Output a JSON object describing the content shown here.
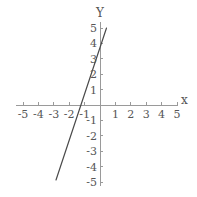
{
  "figure": {
    "background_color": "#ffffff",
    "axis_color": "#9a9a9a",
    "line_color": "#4a4a4a",
    "label_color": "#565656"
  },
  "axes": {
    "x_axis_name": "x",
    "y_axis_name": "Y",
    "x_tick_labels": [
      "-5",
      "-4",
      "-3",
      "-2",
      "-1",
      "1",
      "2",
      "3",
      "4",
      "5"
    ],
    "y_tick_labels": [
      "5",
      "4",
      "3",
      "2",
      "1",
      "-1",
      "-2",
      "-3",
      "-4",
      "-5"
    ]
  },
  "chart_data": {
    "type": "line",
    "title": "",
    "xlabel": "x",
    "ylabel": "Y",
    "xlim": [
      -5.4,
      5.0
    ],
    "ylim": [
      -5.4,
      5.4
    ],
    "xticks": [
      -5,
      -4,
      -3,
      -2,
      -1,
      1,
      2,
      3,
      4,
      5
    ],
    "yticks": [
      5,
      4,
      3,
      2,
      1,
      -1,
      -2,
      -3,
      -4,
      -5
    ],
    "grid": false,
    "legend": null,
    "series": [
      {
        "name": "line",
        "slope": 2.3,
        "intercept": 3.0,
        "x_intercept": -1.3,
        "y_intercept": 3.0,
        "x": [
          -2.85,
          0.4
        ],
        "y": [
          -4.85,
          3.9
        ]
      }
    ]
  },
  "geometry": {
    "origin_x": 100,
    "origin_y": 105,
    "unit_x": 15.4,
    "unit_y": 15.4,
    "x_axis_start": 16,
    "x_axis_end": 178,
    "y_axis_top": 22,
    "y_axis_bottom": 186,
    "tick_size": 3,
    "line_x1": 56,
    "line_y1": 180,
    "line_x2": 106.5,
    "line_y2": 28
  }
}
